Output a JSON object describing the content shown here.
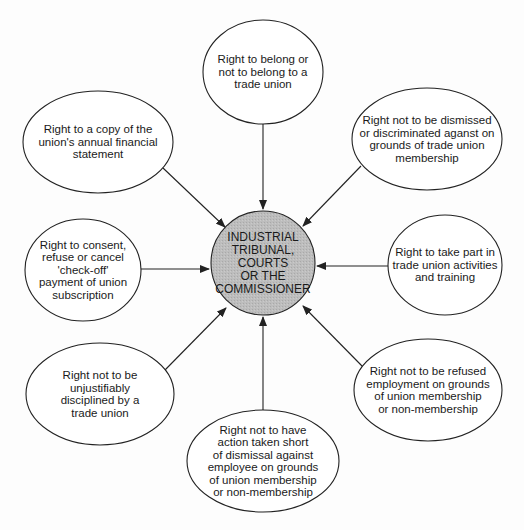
{
  "diagram": {
    "type": "hub-and-spoke",
    "center": {
      "label": "INDUSTRIAL\nTRIBUNAL,\nCOURTS\nOR THE\nCOMMISSIONER",
      "shape": "circle",
      "fill": "#b8b8b8",
      "cx": 263,
      "cy": 263,
      "r": 52
    },
    "nodes": [
      {
        "id": "belong",
        "label": "Right to belong or\nnot to belong to a\ntrade union",
        "cx": 263,
        "cy": 72,
        "rx": 60,
        "ry": 52,
        "arrow_from": [
          263,
          124
        ],
        "arrow_to": [
          263,
          209
        ]
      },
      {
        "id": "financial-statement",
        "label": "Right to a copy of the\nunion's annual financial\nstatement",
        "cx": 98,
        "cy": 142,
        "rx": 75,
        "ry": 51,
        "arrow_from": [
          163,
          168
        ],
        "arrow_to": [
          225,
          227
        ]
      },
      {
        "id": "dismissal",
        "label": "Right not to be dismissed\nor discriminated aganst on\ngrounds of trade union\nmembership",
        "cx": 427,
        "cy": 139,
        "rx": 75,
        "ry": 51,
        "arrow_from": [
          361,
          166
        ],
        "arrow_to": [
          303,
          226
        ]
      },
      {
        "id": "check-off",
        "label": "Right to consent,\nrefuse or cancel\n'check-off'\npayment of union\nsubscription",
        "cx": 83,
        "cy": 270,
        "rx": 58,
        "ry": 51,
        "arrow_from": [
          141,
          269
        ],
        "arrow_to": [
          209,
          269
        ]
      },
      {
        "id": "activities",
        "label": "Right to take part in\ntrade union activities\nand training",
        "cx": 445,
        "cy": 265,
        "rx": 57,
        "ry": 50,
        "arrow_from": [
          388,
          266
        ],
        "arrow_to": [
          317,
          266
        ]
      },
      {
        "id": "disciplined",
        "label": "Right not to be\nunjustifiably\ndisciplined by a\ntrade union",
        "cx": 100,
        "cy": 394,
        "rx": 74,
        "ry": 51,
        "arrow_from": [
          165,
          370
        ],
        "arrow_to": [
          226,
          308
        ]
      },
      {
        "id": "refused-employment",
        "label": "Right not to be refused\nemployment on grounds\nof union membership\nor non-membership",
        "cx": 428,
        "cy": 390,
        "rx": 74,
        "ry": 51,
        "arrow_from": [
          362,
          366
        ],
        "arrow_to": [
          303,
          306
        ]
      },
      {
        "id": "action-short",
        "label": "Right not to have\naction taken short\nof dismissal against\nemployee on grounds\nof union membership\nor non-membership",
        "cx": 263,
        "cy": 461,
        "rx": 76,
        "ry": 51,
        "arrow_from": [
          263,
          410
        ],
        "arrow_to": [
          263,
          317
        ]
      }
    ],
    "colors": {
      "stroke": "#222222",
      "node_fill": "#ffffff",
      "center_fill": "#b8b8b8",
      "text": "#1a1a1a"
    }
  }
}
